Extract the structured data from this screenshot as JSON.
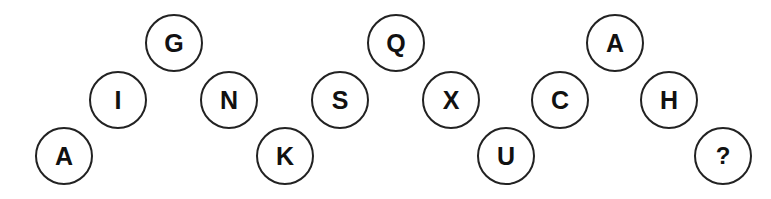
{
  "puzzle": {
    "description": "Letter sequence arranged in zigzag circles; find the missing letter",
    "nodes": [
      {
        "label": "A",
        "x": 64,
        "y": 156
      },
      {
        "label": "I",
        "x": 118,
        "y": 100
      },
      {
        "label": "G",
        "x": 174,
        "y": 43
      },
      {
        "label": "N",
        "x": 229,
        "y": 100
      },
      {
        "label": "K",
        "x": 285,
        "y": 156
      },
      {
        "label": "S",
        "x": 340,
        "y": 100
      },
      {
        "label": "Q",
        "x": 396,
        "y": 43
      },
      {
        "label": "X",
        "x": 451,
        "y": 100
      },
      {
        "label": "U",
        "x": 506,
        "y": 156
      },
      {
        "label": "C",
        "x": 560,
        "y": 100
      },
      {
        "label": "A",
        "x": 615,
        "y": 43
      },
      {
        "label": "H",
        "x": 669,
        "y": 100
      },
      {
        "label": "?",
        "x": 723,
        "y": 156
      }
    ]
  },
  "colors": {
    "background": "#ffffff",
    "stroke": "#222222",
    "text": "#111111"
  }
}
